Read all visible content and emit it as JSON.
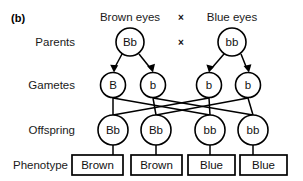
{
  "figure": {
    "panel_label": "(b)",
    "row_labels": {
      "parents": "Parents",
      "gametes": "Gametes",
      "offspring": "Offspring",
      "phenotype": "Phenotype"
    },
    "headers": {
      "left_parent_phenotype": "Brown eyes",
      "right_parent_phenotype": "Blue eyes",
      "cross_symbol_top": "×",
      "cross_symbol_parents": "×"
    },
    "parents": [
      {
        "genotype": "Bb",
        "cx": 130,
        "cy": 42,
        "r": 14
      },
      {
        "genotype": "bb",
        "cx": 232,
        "cy": 42,
        "r": 14
      }
    ],
    "gametes": [
      {
        "allele": "B",
        "cx": 113,
        "cy": 85,
        "r": 12.5
      },
      {
        "allele": "b",
        "cx": 153,
        "cy": 85,
        "r": 12.5
      },
      {
        "allele": "b",
        "cx": 209,
        "cy": 85,
        "r": 12.5
      },
      {
        "allele": "b",
        "cx": 248,
        "cy": 85,
        "r": 12.5
      }
    ],
    "offspring": [
      {
        "genotype": "Bb",
        "cx": 113,
        "cy": 130,
        "r": 15
      },
      {
        "genotype": "Bb",
        "cx": 156,
        "cy": 130,
        "r": 15
      },
      {
        "genotype": "bb",
        "cx": 210,
        "cy": 130,
        "r": 15
      },
      {
        "genotype": "bb",
        "cx": 253,
        "cy": 130,
        "r": 15
      }
    ],
    "phenotypes": [
      {
        "label": "Brown",
        "x": 72,
        "y": 155,
        "w": 51,
        "h": 20
      },
      {
        "label": "Brown",
        "x": 131,
        "y": 155,
        "w": 51,
        "h": 20
      },
      {
        "label": "Blue",
        "x": 188,
        "y": 155,
        "w": 47,
        "h": 20
      },
      {
        "label": "Blue",
        "x": 240,
        "y": 155,
        "w": 47,
        "h": 20
      }
    ],
    "colors": {
      "stroke": "#000000",
      "text": "#111111",
      "background": "#ffffff"
    }
  }
}
